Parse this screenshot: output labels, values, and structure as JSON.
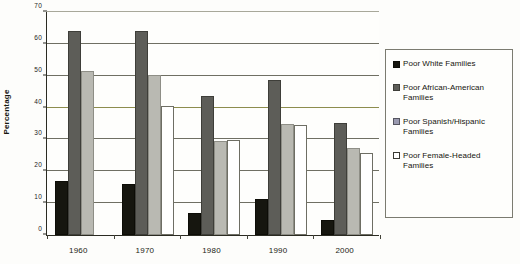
{
  "chart_data": {
    "type": "bar",
    "title": "",
    "subtitle": "",
    "xlabel": "",
    "ylabel": "Percentage",
    "categories": [
      "1960",
      "1970",
      "1980",
      "1990",
      "2000"
    ],
    "ylim": [
      0,
      70
    ],
    "yticks": [
      0,
      10,
      20,
      30,
      40,
      50,
      60,
      70
    ],
    "ytick_labels": [
      "0",
      "10",
      "20",
      "30",
      "40",
      "50",
      "60",
      "70"
    ],
    "grid": true,
    "legend_position": "right",
    "series": [
      {
        "name": "Poor White Families",
        "color": "#16160f",
        "values": [
          17,
          16,
          7,
          11.3,
          4.8
        ]
      },
      {
        "name": "Poor African-American Families",
        "color": "#5d5d58",
        "values": [
          64,
          64,
          43.5,
          48.8,
          35.2
        ]
      },
      {
        "name": "Poor Spanish/Hispanic Families",
        "color": "#b9b9b2",
        "values": [
          51.5,
          50.3,
          29.4,
          35,
          27.4
        ]
      },
      {
        "name": "Poor Female-Headed Families",
        "color": "#ffffff",
        "values": [
          null,
          40.4,
          29.9,
          34.6,
          25.7
        ]
      }
    ]
  },
  "legend": {
    "items": [
      {
        "label": "Poor White Families",
        "swatch": "legend-swatch-black"
      },
      {
        "label": "Poor African-American Families",
        "swatch": "legend-swatch-dark-gray"
      },
      {
        "label": "Poor Spanish/Hispanic Families",
        "swatch": "legend-swatch-light-gray"
      },
      {
        "label": "Poor Female-Headed Families",
        "swatch": "legend-swatch-white"
      }
    ]
  }
}
